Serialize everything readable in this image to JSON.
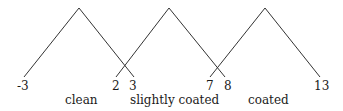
{
  "diagram": {
    "type": "triangular-membership-functions",
    "line_color": "#333333",
    "text_color": "#1a1a1a",
    "sets": [
      {
        "label": "clean",
        "left": -3,
        "peak": -0.5,
        "right": 3
      },
      {
        "label": "slightly coated",
        "left": 2,
        "peak": 5,
        "right": 8
      },
      {
        "label": "coated",
        "left": 7,
        "peak": 10.5,
        "right": 13
      }
    ],
    "tick_labels": [
      "-3",
      "2",
      "3",
      "7",
      "8",
      "13"
    ],
    "category_labels": [
      "clean",
      "slightly coated",
      "coated"
    ]
  }
}
